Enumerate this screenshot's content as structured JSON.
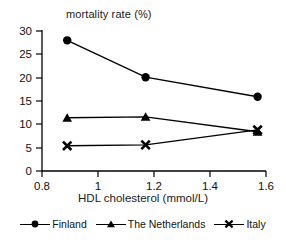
{
  "chart_data": {
    "type": "line",
    "title": "mortality rate (%)",
    "xlabel": "HDL cholesterol (mmol/L)",
    "ylabel": "",
    "xlim": [
      0.8,
      1.6
    ],
    "ylim": [
      0,
      30
    ],
    "xticks": [
      "0.8",
      "1",
      "1.2",
      "1.4",
      "1.6"
    ],
    "xtick_values": [
      0.8,
      1.0,
      1.2,
      1.4,
      1.6
    ],
    "yticks": [
      "0",
      "5",
      "10",
      "15",
      "20",
      "25",
      "30"
    ],
    "ytick_values": [
      0,
      5,
      10,
      15,
      20,
      25,
      30
    ],
    "grid": false,
    "legend_position": "bottom",
    "x": [
      0.89,
      1.17,
      1.57
    ],
    "series": [
      {
        "name": "Finland",
        "marker": "circle",
        "color": "#000000",
        "values": [
          28.0,
          20.1,
          15.9
        ]
      },
      {
        "name": "The Netherlands",
        "marker": "triangle",
        "color": "#000000",
        "values": [
          11.4,
          11.6,
          8.4
        ]
      },
      {
        "name": "Italy",
        "marker": "x",
        "color": "#000000",
        "values": [
          5.4,
          5.6,
          8.8
        ]
      }
    ]
  },
  "legend": {
    "items": [
      {
        "label": "Finland",
        "icon": "circle-marker-icon"
      },
      {
        "label": "The Netherlands",
        "icon": "triangle-marker-icon"
      },
      {
        "label": "Italy",
        "icon": "x-marker-icon"
      }
    ]
  },
  "axes": {
    "x_tick_0": "0.8",
    "x_tick_1": "1",
    "x_tick_2": "1.2",
    "x_tick_3": "1.4",
    "x_tick_4": "1.6",
    "y_tick_0": "0",
    "y_tick_1": "5",
    "y_tick_2": "10",
    "y_tick_3": "15",
    "y_tick_4": "20",
    "y_tick_5": "25",
    "y_tick_6": "30"
  }
}
